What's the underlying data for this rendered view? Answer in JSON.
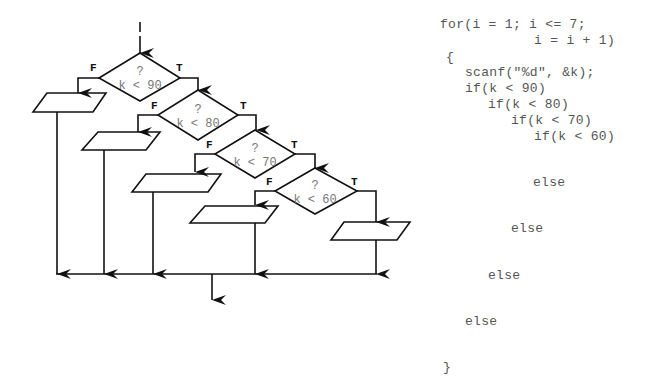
{
  "flowchart": {
    "decisions": [
      {
        "question": "?",
        "condition": "k < 90",
        "true_label": "T",
        "false_label": "F"
      },
      {
        "question": "?",
        "condition": "k < 80",
        "true_label": "T",
        "false_label": "F"
      },
      {
        "question": "?",
        "condition": "k < 70",
        "true_label": "T",
        "false_label": "F"
      },
      {
        "question": "?",
        "condition": "k < 60",
        "true_label": "T",
        "false_label": "F"
      }
    ],
    "io_boxes": 5
  },
  "code": {
    "lines": [
      "for(i = 1; i <= 7;",
      "i = i + 1)",
      "{",
      "scanf(\"%d\", &k);",
      "if(k < 90)",
      "if(k < 80)",
      "if(k < 70)",
      "if(k < 60)",
      "else",
      "else",
      "else",
      "else",
      "}"
    ]
  }
}
